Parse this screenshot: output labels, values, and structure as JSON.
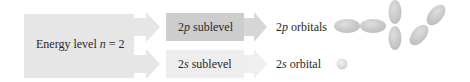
{
  "diagram": {
    "energy_level": {
      "label_prefix": "Energy level ",
      "variable": "n",
      "label_suffix": " = 2",
      "fill": "#e6e6e6"
    },
    "sublevels": [
      {
        "number": "2",
        "letter": "p",
        "suffix": " sublevel",
        "fill": "#cdcdcd",
        "arrow_fill": "#d6d6d6",
        "result_number": "2",
        "result_letter": "p",
        "result_suffix": " orbitals",
        "orbital_icon": "p-orbitals-icon"
      },
      {
        "number": "2",
        "letter": "s",
        "suffix": " sublevel",
        "fill": "#eeeeee",
        "arrow_fill": "#efefef",
        "result_number": "2",
        "result_letter": "s",
        "result_suffix": " orbital",
        "orbital_icon": "s-orbital-icon"
      }
    ],
    "orbital_color": "#c8c8c8"
  }
}
